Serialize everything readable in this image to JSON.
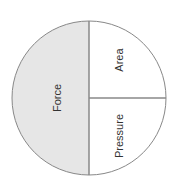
{
  "diagram": {
    "segments": [
      {
        "id": "force",
        "label": "Force",
        "fill": "#e6e6e6"
      },
      {
        "id": "area",
        "label": "Area",
        "fill": "#ffffff"
      },
      {
        "id": "pressure",
        "label": "Pressure",
        "fill": "#ffffff"
      }
    ],
    "stroke_color": "#888888"
  }
}
